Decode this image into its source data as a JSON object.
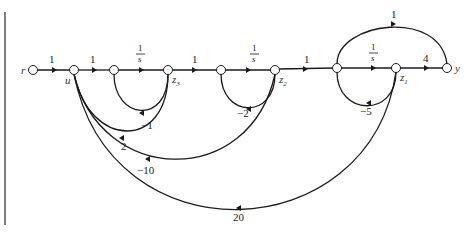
{
  "diagram": {
    "type": "signal-flow-graph",
    "nodes": [
      {
        "id": "r",
        "label": "r"
      },
      {
        "id": "u",
        "label": "u"
      },
      {
        "id": "n2",
        "label": ""
      },
      {
        "id": "z3",
        "label": "z",
        "sub": "3"
      },
      {
        "id": "n4",
        "label": ""
      },
      {
        "id": "z2",
        "label": "z",
        "sub": "2"
      },
      {
        "id": "n5",
        "label": ""
      },
      {
        "id": "z1",
        "label": "z",
        "sub": "1"
      },
      {
        "id": "y",
        "label": "y"
      }
    ],
    "edges": [
      {
        "from": "r",
        "to": "u",
        "gain": "1"
      },
      {
        "from": "u",
        "to": "n2",
        "gain": "1"
      },
      {
        "from": "n2",
        "to": "z3",
        "gain_num": "1",
        "gain_den": "s"
      },
      {
        "from": "z3",
        "to": "n2",
        "gain": "−1"
      },
      {
        "from": "z3",
        "to": "n4",
        "gain": "1"
      },
      {
        "from": "n4",
        "to": "z2",
        "gain_num": "1",
        "gain_den": "s"
      },
      {
        "from": "z2",
        "to": "n4",
        "gain": "−2"
      },
      {
        "from": "z2",
        "to": "n5",
        "gain": "1"
      },
      {
        "from": "n5",
        "to": "z1",
        "gain_num": "1",
        "gain_den": "s"
      },
      {
        "from": "z1",
        "to": "n5",
        "gain": "−5"
      },
      {
        "from": "n5",
        "to": "y",
        "gain": "1"
      },
      {
        "from": "z1",
        "to": "y",
        "gain": "4"
      },
      {
        "from": "z3",
        "to": "u",
        "gain": "2"
      },
      {
        "from": "z2",
        "to": "u",
        "gain": "−10"
      },
      {
        "from": "z1",
        "to": "u",
        "gain": "20"
      }
    ]
  }
}
